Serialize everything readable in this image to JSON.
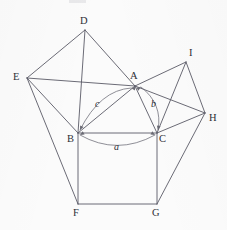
{
  "figure": {
    "canvas": {
      "width": 227,
      "height": 230
    },
    "background_color": "#fbfbfb",
    "line_color": "#5a5a66",
    "arc_color": "#6a6a74",
    "label_color": "#2e2e36",
    "vertices": [
      {
        "id": "A",
        "label": "A",
        "x": 135,
        "y": 86,
        "label_x": 130,
        "label_y": 71
      },
      {
        "id": "B",
        "label": "B",
        "x": 78,
        "y": 133,
        "label_x": 67,
        "label_y": 134
      },
      {
        "id": "C",
        "label": "C",
        "x": 157,
        "y": 133,
        "label_x": 159,
        "label_y": 134
      },
      {
        "id": "D",
        "label": "D",
        "x": 85,
        "y": 30,
        "label_x": 80,
        "label_y": 16
      },
      {
        "id": "E",
        "label": "E",
        "x": 27,
        "y": 78,
        "label_x": 13,
        "label_y": 72
      },
      {
        "id": "F",
        "label": "F",
        "x": 78,
        "y": 204,
        "label_x": 73,
        "label_y": 208
      },
      {
        "id": "G",
        "label": "G",
        "x": 157,
        "y": 204,
        "label_x": 152,
        "label_y": 208
      },
      {
        "id": "H",
        "label": "H",
        "x": 205,
        "y": 113,
        "label_x": 209,
        "label_y": 113
      },
      {
        "id": "I",
        "label": "I",
        "x": 186,
        "y": 62,
        "label_x": 189,
        "label_y": 48
      }
    ],
    "edges": [
      {
        "name": "edge-B-C",
        "from": "B",
        "to": "C"
      },
      {
        "name": "edge-A-B",
        "from": "A",
        "to": "B"
      },
      {
        "name": "edge-A-C",
        "from": "A",
        "to": "C"
      },
      {
        "name": "edge-B-F",
        "from": "B",
        "to": "F"
      },
      {
        "name": "edge-F-G",
        "from": "F",
        "to": "G"
      },
      {
        "name": "edge-G-C",
        "from": "G",
        "to": "C"
      },
      {
        "name": "edge-B-D",
        "from": "B",
        "to": "D"
      },
      {
        "name": "edge-D-E",
        "from": "D",
        "to": "E"
      },
      {
        "name": "edge-E-B",
        "from": "E",
        "to": "B"
      },
      {
        "name": "edge-C-I",
        "from": "C",
        "to": "I"
      },
      {
        "name": "edge-I-H",
        "from": "I",
        "to": "H"
      },
      {
        "name": "edge-H-C",
        "from": "H",
        "to": "C"
      },
      {
        "name": "edge-A-D",
        "from": "A",
        "to": "D"
      },
      {
        "name": "edge-A-I",
        "from": "A",
        "to": "I"
      },
      {
        "name": "edge-A-E",
        "from": "A",
        "to": "E"
      },
      {
        "name": "edge-A-H",
        "from": "A",
        "to": "H"
      },
      {
        "name": "edge-E-F",
        "from": "E",
        "to": "F"
      },
      {
        "name": "edge-H-G",
        "from": "H",
        "to": "G"
      }
    ],
    "side_labels": [
      {
        "id": "a",
        "label": "a",
        "x": 114,
        "y": 142,
        "describes": "side-BC"
      },
      {
        "id": "b",
        "label": "b",
        "x": 151,
        "y": 99,
        "describes": "side-AC"
      },
      {
        "id": "c",
        "label": "c",
        "x": 95,
        "y": 99,
        "describes": "side-AB"
      }
    ],
    "arcs": [
      {
        "name": "arc-a",
        "label": "a",
        "path": "M 80 135 Q 117 156 155 135",
        "arrow_start": {
          "x": 80,
          "y": 135,
          "angle": 150
        },
        "arrow_end": {
          "x": 155,
          "y": 135,
          "angle": 30
        }
      },
      {
        "name": "arc-b",
        "label": "b",
        "path": "M 141 87 Q 163 104 158 130",
        "arrow_start": {
          "x": 141,
          "y": 87,
          "angle": 330
        },
        "arrow_end": {
          "x": 158,
          "y": 130,
          "angle": 100
        }
      },
      {
        "name": "arc-c",
        "label": "c",
        "path": "M 131 88 Q 100 90 80 130",
        "arrow_start": {
          "x": 131,
          "y": 88,
          "angle": 190
        },
        "arrow_end": {
          "x": 80,
          "y": 130,
          "angle": 116
        }
      }
    ]
  }
}
